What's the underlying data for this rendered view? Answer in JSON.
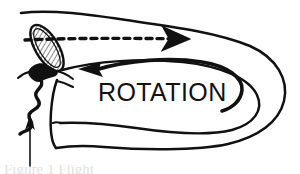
{
  "figure": {
    "background_color": "#ffffff",
    "ink_color": "#111111",
    "labels": {
      "rotation": "ROTATION"
    },
    "caption_fragment": "Figure 1  Flight",
    "annotations": [
      {
        "name": "trajectory-arrow",
        "style": "dashed",
        "direction": "left-to-right",
        "description": "dashed flight path arrow across upper part of vortex"
      },
      {
        "name": "rotation-arrow",
        "style": "solid-curved",
        "direction": "right-to-left",
        "description": "curved arrow indicating sense of rotation inside the tube"
      },
      {
        "name": "pointer-arrow",
        "style": "thin-solid",
        "direction": "upward",
        "description": "thin arrow pointing up at the wavy tail"
      }
    ],
    "objects": [
      {
        "name": "hatched-body",
        "shape": "tilted-ellipse",
        "fill": "hatched",
        "description": "elongated stippled/hatched oval body at upper left"
      },
      {
        "name": "black-blob",
        "shape": "irregular-blob",
        "fill": "solid",
        "description": "solid black mass below the hatched body"
      },
      {
        "name": "wavy-tail",
        "shape": "zigzag-line",
        "fill": "solid",
        "description": "wavy tail trailing down-left from the black blob"
      },
      {
        "name": "vortex-outline",
        "shape": "nested-u-curves",
        "fill": "none",
        "description": "nested open curves forming the rotating tube / vortex"
      }
    ]
  }
}
